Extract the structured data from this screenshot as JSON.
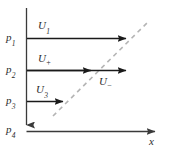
{
  "figure": {
    "background_color": "#ffffff",
    "axis_color": "#3a3a3a",
    "arrow_color": "#1a1a1a",
    "dashed_color": "#b0b0b0",
    "text_color": "#2b2b2b"
  },
  "axes": {
    "x_axis_label": "x",
    "x_axis_label_full": "x",
    "vertical_axis_name": "pressure-axis",
    "horizontal_axis_name": "x-axis"
  },
  "pressure_labels": [
    {
      "base": "p",
      "sub": "1"
    },
    {
      "base": "p",
      "sub": "2"
    },
    {
      "base": "p",
      "sub": "3"
    },
    {
      "base": "p",
      "sub": "4"
    }
  ],
  "velocity_labels": [
    {
      "base": "U",
      "sub": "1",
      "sub_kind": "digit"
    },
    {
      "base": "U",
      "sub": "+",
      "sub_kind": "sign"
    },
    {
      "base": "U",
      "sub": "3",
      "sub_kind": "digit"
    },
    {
      "base": "U",
      "sub": "−",
      "sub_kind": "sign"
    }
  ],
  "arrows": [
    {
      "name": "velocity-arrow-1",
      "length_label": "long"
    },
    {
      "name": "velocity-arrow-2",
      "length_label": "long"
    },
    {
      "name": "velocity-arrow-2b",
      "length_label": "medium"
    },
    {
      "name": "velocity-arrow-3",
      "length_label": "short"
    }
  ],
  "dashed_line": {
    "name": "characteristic-dashed-line",
    "style": "dashed",
    "orientation": "diagonal-up-right"
  }
}
